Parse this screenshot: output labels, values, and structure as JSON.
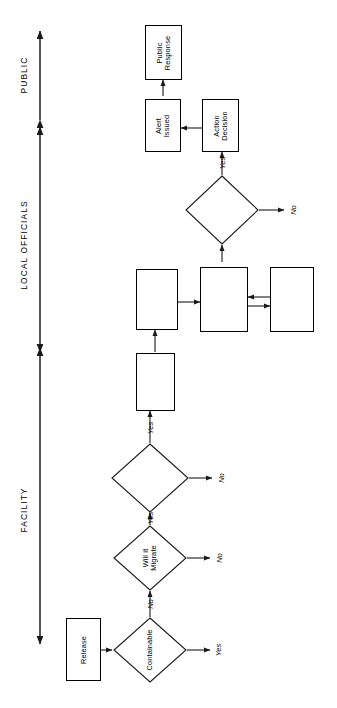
{
  "diagram": {
    "orientation": "rotated-90-ccw",
    "line_color": "#1a1a1a",
    "fill_color": "#ffffff",
    "bands": [
      {
        "id": "facility",
        "label": "FACILITY",
        "arrow": "double"
      },
      {
        "id": "local-officials",
        "label": "LOCAL OFFICIALS",
        "arrow": "double"
      },
      {
        "id": "public",
        "label": "PUBLIC",
        "arrow": "double"
      }
    ],
    "nodes": [
      {
        "id": "release",
        "shape": "box",
        "label": "Release"
      },
      {
        "id": "containable",
        "shape": "diamond",
        "label": "Containable"
      },
      {
        "id": "will-it-migrate",
        "shape": "diamond",
        "label": "Will it\nMigrate"
      },
      {
        "id": "will-it-threaten",
        "shape": "diamond",
        "label": "Will it\nThreaten\nPublic"
      },
      {
        "id": "notify-local",
        "shape": "box",
        "label": "Notify\nLocal\nOfficials"
      },
      {
        "id": "official-decision",
        "shape": "box",
        "label": "Official\nDecision-\nMaking"
      },
      {
        "id": "contact-committee",
        "shape": "box",
        "label": "Contact\nEmergency\nResponse\nCommittee"
      },
      {
        "id": "acquire-info",
        "shape": "box",
        "label": "Acquire\nInformation/\nEvaluate"
      },
      {
        "id": "should-warn",
        "shape": "diamond",
        "label": "Should\nPublic be\nWarned"
      },
      {
        "id": "action-decision",
        "shape": "box",
        "label": "Action\nDecision"
      },
      {
        "id": "alert-issued",
        "shape": "box",
        "label": "Alert\nIssued"
      },
      {
        "id": "public-response",
        "shape": "box",
        "label": "Public\nResponse"
      }
    ],
    "edge_labels": [
      {
        "id": "containable-yes",
        "label": "Yes"
      },
      {
        "id": "containable-no",
        "label": "No"
      },
      {
        "id": "migrate-no",
        "label": "No"
      },
      {
        "id": "migrate-yes",
        "label": "Yes"
      },
      {
        "id": "threaten-no",
        "label": "No"
      },
      {
        "id": "threaten-yes",
        "label": "Yes"
      },
      {
        "id": "should-warn-no",
        "label": "No"
      },
      {
        "id": "should-warn-yes",
        "label": "Yes"
      }
    ]
  }
}
